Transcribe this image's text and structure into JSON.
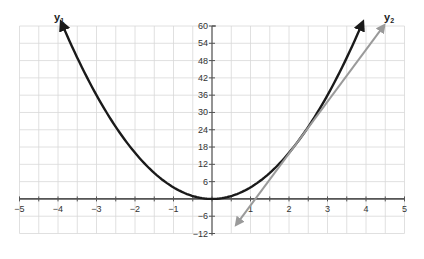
{
  "chart_data": {
    "type": "line",
    "title": "",
    "xlabel": "",
    "ylabel": "",
    "xlim": [
      -5,
      5
    ],
    "ylim": [
      -12,
      60
    ],
    "grid": true,
    "grid_x_step": 0.5,
    "grid_y_step": 6,
    "x_ticks": [
      -5,
      -4,
      -3,
      -2,
      -1,
      1,
      2,
      3,
      4,
      5
    ],
    "x_tick_labels": [
      "−5",
      "−4",
      "−3",
      "−2",
      "−1",
      "1",
      "2",
      "3",
      "4",
      "5"
    ],
    "y_ticks": [
      60,
      54,
      48,
      42,
      36,
      30,
      24,
      18,
      12,
      6,
      -6,
      -12
    ],
    "y_tick_labels": [
      "60",
      "54",
      "48",
      "42",
      "36",
      "30",
      "24",
      "18",
      "12",
      "6",
      "−6",
      "−12"
    ],
    "series": [
      {
        "name": "y1",
        "label_main": "y",
        "label_sub": "1",
        "kind": "parabola",
        "equation": "y = 4x^2",
        "x_range": [
          -3.9,
          3.9
        ],
        "color": "#1a1a1a",
        "arrows": "both",
        "points": [
          [
            -3.9,
            60.8
          ],
          [
            -3,
            36
          ],
          [
            -2,
            16
          ],
          [
            -1,
            4
          ],
          [
            0,
            0
          ],
          [
            1,
            4
          ],
          [
            2,
            16
          ],
          [
            3,
            36
          ],
          [
            3.9,
            60.8
          ]
        ]
      },
      {
        "name": "y2",
        "label_main": "y",
        "label_sub": "2",
        "kind": "line",
        "equation": "y = 18x - 20.25",
        "x_range": [
          0.65,
          4.45
        ],
        "color": "#9a9a9a",
        "arrows": "both",
        "points": [
          [
            0.65,
            -8.55
          ],
          [
            1.125,
            0
          ],
          [
            2.25,
            20.25
          ],
          [
            4.45,
            59.85
          ]
        ]
      }
    ],
    "legend": "inline labels at arrow tips"
  },
  "colors": {
    "grid": "#d8d8d8",
    "axis": "#555555",
    "y1": "#1a1a1a",
    "y2": "#9a9a9a"
  }
}
